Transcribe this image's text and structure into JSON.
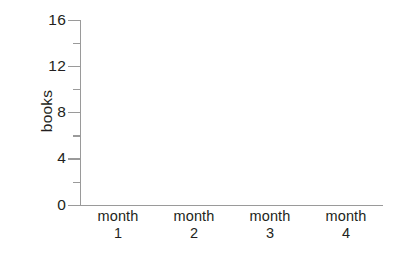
{
  "chart_data": {
    "type": "bar",
    "title": "",
    "subtitle": "",
    "xlabel": "",
    "ylabel": "books",
    "categories": [
      "month 1",
      "month 2",
      "month 3",
      "month 4"
    ],
    "category_names": [
      "month",
      "month",
      "month",
      "month"
    ],
    "category_numbers": [
      "1",
      "2",
      "3",
      "4"
    ],
    "values": [
      null,
      null,
      null,
      null
    ],
    "ylim": [
      0,
      16
    ],
    "xlim": [
      0,
      4
    ],
    "y_major_ticks": [
      0,
      4,
      8,
      12,
      16
    ],
    "y_major_tick_labels": [
      "0",
      "4",
      "8",
      "12",
      "16"
    ],
    "y_minor_ticks": [
      2,
      6,
      10,
      14
    ],
    "grid": false,
    "legend": false,
    "legend_position": "none",
    "annotations": []
  },
  "axes": {
    "y_title": "books",
    "y_tick_labels": [
      "16",
      "12",
      "8",
      "4",
      "0"
    ],
    "x_categories": [
      {
        "name": "month",
        "number": "1"
      },
      {
        "name": "month",
        "number": "2"
      },
      {
        "name": "month",
        "number": "3"
      },
      {
        "name": "month",
        "number": "4"
      }
    ]
  },
  "colors": {
    "background": "#ffffff",
    "axis": "#9a9a9a",
    "text": "#231f20"
  }
}
